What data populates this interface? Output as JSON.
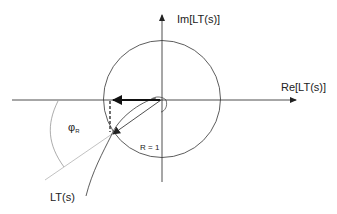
{
  "diagram": {
    "type": "nyquist-phase-margin",
    "axes": {
      "real_label": "Re[LT(s)]",
      "imag_label": "Im[LT(s)]"
    },
    "unit_circle": {
      "label": "R = 1"
    },
    "curve_label": "LT(s)",
    "phase_margin": {
      "symbol": "φ",
      "subscript": "R"
    },
    "colors": {
      "line": "#222222",
      "grey_line": "#bbbbbb",
      "arc": "#888888",
      "background": "#ffffff"
    }
  }
}
